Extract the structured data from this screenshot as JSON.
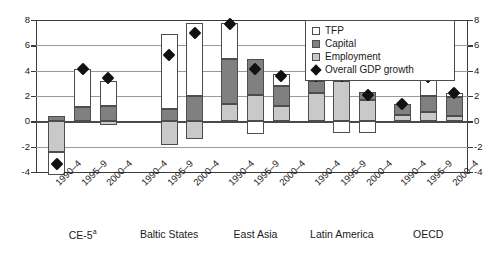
{
  "chart_data": {
    "type": "bar",
    "title": "",
    "subtitle": "",
    "xlabel": "",
    "ylabel": "",
    "ylim": [
      -4,
      8
    ],
    "yticks": [
      -4,
      -2,
      0,
      2,
      4,
      6,
      8
    ],
    "ytick_labels": [
      "-4",
      "-2",
      "0",
      "2",
      "4",
      "6",
      "8"
    ],
    "grid": true,
    "stacked": true,
    "dual_axis": true,
    "legend_position": "top-right",
    "legend": [
      {
        "label": "TFP",
        "marker": "square",
        "color": "#ffffff"
      },
      {
        "label": "Capital",
        "marker": "square",
        "color": "#808080"
      },
      {
        "label": "Employment",
        "marker": "square",
        "color": "#c9c9c9"
      },
      {
        "label": "Overall GDP growth",
        "marker": "diamond",
        "color": "#111111"
      }
    ],
    "groups": [
      {
        "name": "CE-5",
        "footnote": "a",
        "periods": [
          {
            "label": "1990–4",
            "employment": -2.4,
            "capital": 0.4,
            "tfp": -1.8,
            "gdp": -3.4
          },
          {
            "label": "1995–9",
            "employment": 0.0,
            "capital": 1.1,
            "tfp": 3.0,
            "gdp": 4.1
          },
          {
            "label": "2000–4",
            "employment": -0.3,
            "capital": 1.2,
            "tfp": 2.0,
            "gdp": 3.4
          }
        ]
      },
      {
        "name": "Baltic States",
        "footnote": "",
        "periods": [
          {
            "label": "1990–4",
            "employment": null,
            "capital": null,
            "tfp": null,
            "gdp": null
          },
          {
            "label": "1995–9",
            "employment": -1.9,
            "capital": 1.0,
            "tfp": 5.9,
            "gdp": 5.2
          },
          {
            "label": "2000–4",
            "employment": -1.4,
            "capital": 2.0,
            "tfp": 5.8,
            "gdp": 7.0
          }
        ]
      },
      {
        "name": "East Asia",
        "footnote": "",
        "periods": [
          {
            "label": "1990–4",
            "employment": 1.4,
            "capital": 3.5,
            "tfp": 2.9,
            "gdp": 7.7
          },
          {
            "label": "1995–9",
            "employment": 2.1,
            "capital": 2.8,
            "tfp": -1.0,
            "gdp": 4.1
          },
          {
            "label": "2000–4",
            "employment": 1.2,
            "capital": 1.6,
            "tfp": 0.9,
            "gdp": 3.6
          }
        ]
      },
      {
        "name": "Latin America",
        "footnote": "",
        "periods": [
          {
            "label": "1990–4",
            "employment": 2.2,
            "capital": 1.0,
            "tfp": 0.4,
            "gdp": 3.6
          },
          {
            "label": "1995–9",
            "employment": 3.2,
            "capital": 0.5,
            "tfp": -0.9,
            "gdp": 3.6
          },
          {
            "label": "2000–4",
            "employment": 1.7,
            "capital": 0.6,
            "tfp": -0.9,
            "gdp": 2.1
          }
        ]
      },
      {
        "name": "OECD",
        "footnote": "",
        "periods": [
          {
            "label": "1990–4",
            "employment": 0.5,
            "capital": 0.9,
            "tfp": 0.0,
            "gdp": 1.4
          },
          {
            "label": "1995–9",
            "employment": 0.7,
            "capital": 1.3,
            "tfp": 1.5,
            "gdp": 3.5
          },
          {
            "label": "2000–4",
            "employment": 0.4,
            "capital": 1.5,
            "tfp": 0.3,
            "gdp": 2.2
          }
        ]
      }
    ]
  }
}
